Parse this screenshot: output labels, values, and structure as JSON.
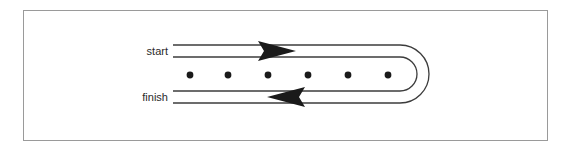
{
  "figure": {
    "width": 567,
    "height": 150,
    "background_color": "#ffffff",
    "border": {
      "color": "#9a9a9a",
      "width": 1,
      "x": 23,
      "y": 10,
      "w": 525,
      "h": 131
    }
  },
  "labels": {
    "start": "start",
    "finish": "finish"
  },
  "diagram": {
    "line_color": "#3c3c3c",
    "line_width": 1,
    "arrow_color": "#1a1a1a",
    "dot_color": "#1a1a1a",
    "dot_radius": 3.2,
    "dot_count": 6,
    "dot_positions_x": [
      190,
      228,
      268,
      308,
      348,
      388
    ],
    "dot_center_y": 75,
    "track_top_outer_y": 45,
    "track_top_inner_y": 57,
    "track_bottom_inner_y": 91,
    "track_bottom_outer_y": 103,
    "track_left_x": 173,
    "track_turn_x": 400,
    "arrows": [
      {
        "name": "start-arrow",
        "direction": "right",
        "tip_x": 295,
        "base_x": 258,
        "center_y": 51,
        "half_height": 10
      },
      {
        "name": "finish-arrow",
        "direction": "left",
        "tip_x": 268,
        "base_x": 305,
        "center_y": 97,
        "half_height": 10
      }
    ],
    "label_positions": {
      "start": {
        "x": 168,
        "y": 55,
        "anchor": "end"
      },
      "finish": {
        "x": 168,
        "y": 101,
        "anchor": "end"
      }
    }
  }
}
